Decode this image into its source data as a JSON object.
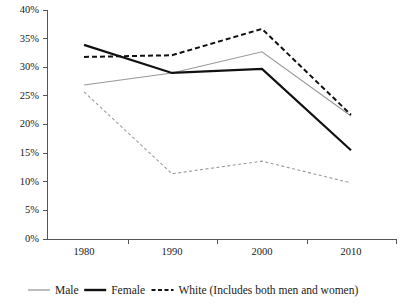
{
  "chart_data": {
    "type": "line",
    "title": "",
    "subtitle": "",
    "xlabel": "",
    "ylabel": "",
    "x": [
      1980,
      1990,
      2000,
      2010
    ],
    "categories": [
      "1980",
      "1990",
      "2000",
      "2010"
    ],
    "xtick_labels": [
      "1980",
      "1990",
      "2000",
      "2010"
    ],
    "ytick_labels": [
      "0%",
      "5%",
      "10%",
      "15%",
      "20%",
      "25%",
      "30%",
      "35%",
      "40%"
    ],
    "ytick_values": [
      0,
      5,
      10,
      15,
      20,
      25,
      30,
      35,
      40
    ],
    "ylim": [
      0,
      40
    ],
    "xlim": [
      1975,
      2015
    ],
    "grid": false,
    "legend_position": "bottom",
    "series": [
      {
        "name": "Male",
        "values": [
          26.9,
          29.0,
          32.7,
          21.5
        ],
        "color": "#999999",
        "style": "solid",
        "width": 1.2,
        "in_legend": true
      },
      {
        "name": "Female",
        "values": [
          33.9,
          29.0,
          29.7,
          15.5
        ],
        "color": "#111111",
        "style": "solid",
        "width": 2.2,
        "in_legend": true
      },
      {
        "name": "White (Includes both men and women)",
        "values": [
          31.8,
          32.1,
          36.7,
          21.7
        ],
        "color": "#111111",
        "style": "dashed",
        "width": 2.0,
        "in_legend": true
      },
      {
        "name": "",
        "values": [
          25.7,
          11.4,
          13.6,
          9.8
        ],
        "color": "#9a9a9a",
        "style": "dashed",
        "width": 1.1,
        "in_legend": false
      }
    ]
  },
  "legend": {
    "items": [
      {
        "label": "Male",
        "color": "#999999",
        "style": "solid"
      },
      {
        "label": "Female",
        "color": "#111111",
        "style": "solid"
      },
      {
        "label": "White (Includes both men and women)",
        "color": "#111111",
        "style": "dashed"
      }
    ]
  },
  "axis": {
    "y_min_label": "0%",
    "y_max_label": "40%"
  }
}
